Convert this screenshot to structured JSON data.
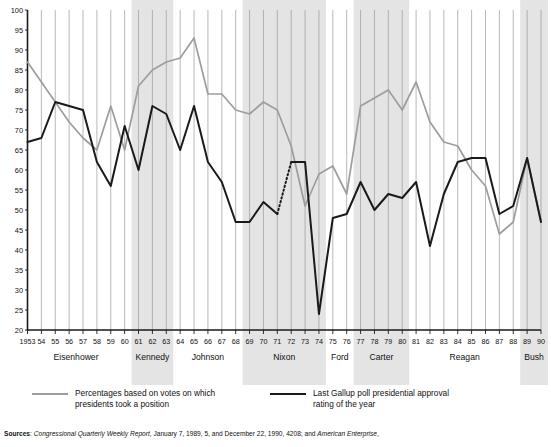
{
  "chart_data": {
    "type": "line",
    "title": "",
    "xlabel": "",
    "ylabel": "",
    "ylim": [
      20,
      100
    ],
    "ytick_step": 5,
    "yticks": [
      20,
      25,
      30,
      35,
      40,
      45,
      50,
      55,
      60,
      65,
      70,
      75,
      80,
      85,
      90,
      95,
      100
    ],
    "grid": "vertical gridlines at each year",
    "legend_position": "below plot",
    "x": [
      1953,
      1954,
      1955,
      1956,
      1957,
      1958,
      1959,
      1960,
      1961,
      1962,
      1963,
      1964,
      1965,
      1966,
      1967,
      1968,
      1969,
      1970,
      1971,
      1972,
      1973,
      1974,
      1975,
      1976,
      1977,
      1978,
      1979,
      1980,
      1981,
      1982,
      1983,
      1984,
      1985,
      1986,
      1987,
      1988,
      1989,
      1990
    ],
    "xtick_labels": [
      "1953",
      "54",
      "55",
      "56",
      "57",
      "58",
      "59",
      "60",
      "61",
      "62",
      "63",
      "64",
      "65",
      "66",
      "67",
      "68",
      "69",
      "70",
      "71",
      "72",
      "73",
      "74",
      "75",
      "76",
      "77",
      "78",
      "79",
      "80",
      "81",
      "82",
      "83",
      "84",
      "85",
      "86",
      "87",
      "88",
      "89",
      "90"
    ],
    "series": [
      {
        "name": "Percentages based on votes on which presidents took a position",
        "color": "#9d9d9d",
        "values": [
          87,
          82,
          77,
          72,
          68,
          65,
          76,
          65,
          81,
          85,
          87,
          88,
          93,
          79,
          79,
          75,
          74,
          77,
          75,
          66,
          51,
          59,
          61,
          54,
          76,
          78,
          80,
          75,
          82,
          72,
          67,
          66,
          60,
          56,
          44,
          47,
          63,
          47
        ]
      },
      {
        "name": "Last Gallup poll presidential approval rating of the year",
        "color": "#1a1a1a",
        "values": [
          67,
          68,
          77,
          76,
          75,
          62,
          56,
          71,
          60,
          76,
          74,
          65,
          76,
          62,
          57,
          47,
          47,
          52,
          49,
          62,
          62,
          24,
          48,
          49,
          57,
          50,
          54,
          53,
          57,
          41,
          54,
          62,
          63,
          63,
          49,
          51,
          63,
          47
        ],
        "dashed_segment": {
          "from": 1971,
          "to": 1972,
          "note": "dotted interpolation"
        }
      }
    ],
    "shaded_bands": [
      {
        "label": "Kennedy",
        "from": 1961,
        "to": 1963
      },
      {
        "label": "Nixon",
        "from": 1969,
        "to": 1974
      },
      {
        "label": "Carter",
        "from": 1977,
        "to": 1980
      },
      {
        "label": "Bush",
        "from": 1989,
        "to": 1990
      }
    ],
    "presidents": [
      {
        "name": "Eisenhower",
        "from": 1953,
        "to": 1960,
        "shaded": false
      },
      {
        "name": "Kennedy",
        "from": 1961,
        "to": 1963,
        "shaded": true
      },
      {
        "name": "Johnson",
        "from": 1964,
        "to": 1968,
        "shaded": false
      },
      {
        "name": "Nixon",
        "from": 1969,
        "to": 1974,
        "shaded": true
      },
      {
        "name": "Ford",
        "from": 1975,
        "to": 1976,
        "shaded": false
      },
      {
        "name": "Carter",
        "from": 1977,
        "to": 1980,
        "shaded": true
      },
      {
        "name": "Reagan",
        "from": 1981,
        "to": 1988,
        "shaded": false
      },
      {
        "name": "Bush",
        "from": 1989,
        "to": 1990,
        "shaded": true
      }
    ]
  },
  "legend": {
    "grey_line_1": "Percentages based on votes on which",
    "grey_line_2": "presidents took a position",
    "black_line_1": "Last Gallup poll presidential approval",
    "black_line_2": "rating of the year"
  },
  "sources": {
    "label": "Sources",
    "italic_1": "Congressional Quarterly Weekly Report",
    "plain_1": ", January 7, 1989, 5, and December 22, 1990, 4208; and ",
    "italic_2": "American Enterprise",
    "plain_2": ","
  },
  "colors": {
    "grey_series": "#9d9d9d",
    "black_series": "#1a1a1a",
    "band": "#e4e4e4",
    "gridline": "#9a9a9a",
    "background": "#ffffff"
  }
}
